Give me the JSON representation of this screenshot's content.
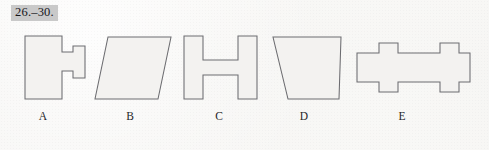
{
  "page": {
    "background_color": "#f6f5f3",
    "type": "scanned-worksheet-figure-strip"
  },
  "exercise": {
    "label": "26.–30.",
    "highlight_color": "#c9c9c9",
    "text_color": "#16161a"
  },
  "figures": {
    "stroke_color": "#6c6c70",
    "fill_color": "#f3f2f0",
    "items": [
      {
        "id": "shape-a",
        "caption": "A",
        "description": "asymmetric H / dumbbell: large rectangle left joined by neck to small rectangle right",
        "points": "25,36 62,36 62,52 73,52 73,46 85,46 85,78 73,78 73,71 62,71 62,99 25,99"
      },
      {
        "id": "shape-b",
        "caption": "B",
        "description": "parallelogram slanting to the right",
        "points": "108,37 171,37 158,99 95,99"
      },
      {
        "id": "shape-c",
        "caption": "C",
        "description": "symmetric H shape / I-beam upright",
        "points": "184,36 203,36 203,60 238,60 238,36 257,36 257,99 238,99 238,75 203,75 203,99 184,99"
      },
      {
        "id": "shape-d",
        "caption": "D",
        "description": "trapezoid, wider top edge, slanted left side",
        "points": "273,37 341,37 339,99 288,99"
      },
      {
        "id": "shape-e",
        "caption": "E",
        "description": "horizontal I-beam bar with two tabs top and bottom (shape C rotated 90 degrees)",
        "points": "357,53 379,53 379,43 398,43 398,53 440,53 440,43 459,43 459,53 470,53 470,82 459,82 459,92 440,92 440,82 398,82 398,92 379,92 379,82 357,82"
      }
    ]
  },
  "captions": {
    "a": "A",
    "b": "B",
    "c": "C",
    "d": "D",
    "e": "E"
  }
}
